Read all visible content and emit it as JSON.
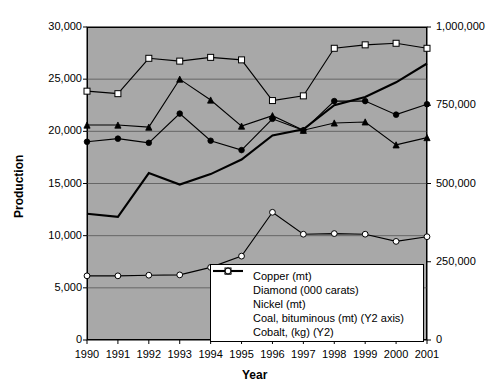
{
  "chart_data": {
    "type": "line",
    "title": "",
    "xlabel": "Year",
    "ylabel": "Production",
    "y2label": "",
    "grid": true,
    "legend_position": "inside-bottom-center",
    "x": [
      1990,
      1991,
      1992,
      1993,
      1994,
      1995,
      1996,
      1997,
      1998,
      1999,
      2000,
      2001
    ],
    "categories": [
      "1990",
      "1991",
      "1992",
      "1993",
      "1994",
      "1995",
      "1996",
      "1997",
      "1998",
      "1999",
      "2000",
      "2001"
    ],
    "ylim": [
      0,
      30000
    ],
    "yticks": [
      0,
      5000,
      10000,
      15000,
      20000,
      25000,
      30000
    ],
    "ytick_labels": [
      "0",
      "5,000",
      "10,000",
      "15,000",
      "20,000",
      "25,000",
      "30,000"
    ],
    "y2lim": [
      0,
      1000000
    ],
    "y2ticks": [
      0,
      250000,
      500000,
      750000,
      1000000
    ],
    "y2tick_labels": [
      "0",
      "250,000",
      "500,000",
      "750,000",
      "1,000,000"
    ],
    "series": [
      {
        "name": "Copper (mt)",
        "axis": "y1",
        "marker": "filled-triangle",
        "color": "#000000",
        "values": [
          20600,
          20600,
          20400,
          25000,
          23000,
          20500,
          21500,
          20100,
          20800,
          20900,
          18700,
          19400
        ]
      },
      {
        "name": "Diamond (000 carats)",
        "axis": "y1",
        "marker": "none",
        "color": "#000000",
        "values": [
          12100,
          11800,
          16000,
          14900,
          15900,
          17300,
          19600,
          20200,
          22500,
          23300,
          24700,
          26500
        ]
      },
      {
        "name": "Nickel (mt)",
        "axis": "y1",
        "marker": "filled-circle",
        "color": "#000000",
        "values": [
          19000,
          19300,
          18900,
          21700,
          19100,
          18200,
          21200,
          20100,
          22900,
          22900,
          21600,
          22600
        ]
      },
      {
        "name": "Coal, bituminous (mt) (Y2 axis)",
        "axis": "y2",
        "marker": "open-square",
        "color": "#000000",
        "values": [
          795000,
          787000,
          900000,
          891000,
          903000,
          895000,
          765000,
          780000,
          932000,
          943000,
          948000,
          932000
        ]
      },
      {
        "name": "Cobalt, (kg) (Y2)",
        "axis": "y2",
        "marker": "open-circle",
        "color": "#000000",
        "values": [
          205000,
          205000,
          207000,
          208000,
          232000,
          268000,
          408000,
          338000,
          340000,
          338000,
          315000,
          330000
        ]
      }
    ]
  },
  "axes": {
    "y_title": "Production",
    "x_title": "Year"
  }
}
